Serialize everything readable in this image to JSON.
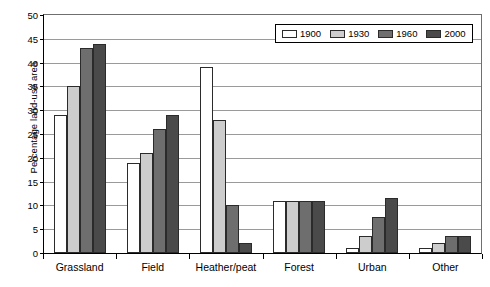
{
  "chart_data": {
    "type": "bar",
    "title": "",
    "xlabel": "",
    "ylabel": "Percentage land-use area",
    "categories": [
      "Grassland",
      "Field",
      "Heather/peat",
      "Forest",
      "Urban",
      "Other"
    ],
    "series": [
      {
        "name": "1900",
        "color": "#ffffff",
        "values": [
          29,
          19,
          39,
          11,
          1,
          1
        ]
      },
      {
        "name": "1930",
        "color": "#cdcdcd",
        "values": [
          35,
          21,
          28,
          11,
          3.5,
          2
        ]
      },
      {
        "name": "1960",
        "color": "#6e6e6e",
        "values": [
          43,
          26,
          10,
          11,
          7.5,
          3.5
        ]
      },
      {
        "name": "2000",
        "color": "#4a4a4a",
        "values": [
          44,
          29,
          2,
          11,
          11.5,
          3.5
        ]
      }
    ],
    "ylim": [
      0,
      50
    ],
    "ytick_values": [
      0,
      5,
      10,
      15,
      20,
      25,
      30,
      35,
      40,
      45,
      50
    ],
    "ytick_labels": [
      "0",
      "5",
      "10",
      "15",
      "20",
      "25",
      "30",
      "35",
      "40",
      "45",
      "50"
    ],
    "grid": true,
    "legend_position": "top-right",
    "legend_entries": [
      "1900",
      "1930",
      "1960",
      "2000"
    ]
  }
}
